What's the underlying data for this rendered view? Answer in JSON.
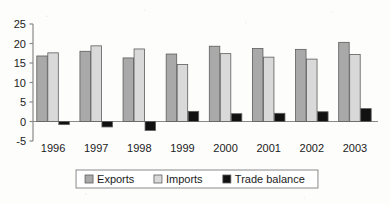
{
  "chart_data": {
    "type": "bar",
    "title": "",
    "subtitle": "",
    "xlabel": "",
    "ylabel": "",
    "categories": [
      "1996",
      "1997",
      "1998",
      "1999",
      "2000",
      "2001",
      "2002",
      "2003"
    ],
    "series": [
      {
        "name": "Exports",
        "color": "#a9a9a9",
        "values": [
          16.8,
          18.0,
          16.3,
          17.3,
          19.3,
          18.7,
          18.5,
          20.3
        ]
      },
      {
        "name": "Imports",
        "color": "#d9d9d9",
        "values": [
          17.6,
          19.4,
          18.6,
          14.6,
          17.4,
          16.5,
          16.0,
          17.2
        ]
      },
      {
        "name": "Trade balance",
        "color": "#111111",
        "values": [
          -0.8,
          -1.4,
          -2.3,
          2.6,
          2.0,
          2.1,
          2.5,
          3.3
        ]
      }
    ],
    "ylim": [
      -5,
      25
    ],
    "ytick_values": [
      -5,
      0,
      5,
      10,
      15,
      20,
      25
    ],
    "ytick_labels": [
      "-5",
      "0",
      "5",
      "10",
      "15",
      "20",
      "25"
    ],
    "grid": false,
    "legend_position": "bottom",
    "legend_entries": [
      "Exports",
      "Imports",
      "Trade balance"
    ],
    "axis_color": "#8a8a8a",
    "zero_line": 0
  }
}
